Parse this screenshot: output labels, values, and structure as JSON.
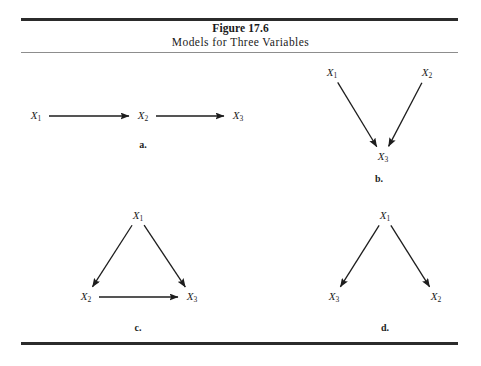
{
  "figure": {
    "number": "Figure 17.6",
    "caption": "Models for Three Variables"
  },
  "chart_data": {
    "type": "diagram",
    "title": "Figure 17.6",
    "subtitle": "Models for Three Variables",
    "panels": [
      {
        "id": "a",
        "label": "a.",
        "layout": "chain-horizontal",
        "nodes": [
          {
            "id": "X1",
            "text": "X",
            "sub": "1",
            "x": 36,
            "y": 116
          },
          {
            "id": "X2",
            "text": "X",
            "sub": "2",
            "x": 143,
            "y": 116
          },
          {
            "id": "X3",
            "text": "X",
            "sub": "3",
            "x": 238,
            "y": 116
          }
        ],
        "edges": [
          {
            "from": "X1",
            "to": "X2"
          },
          {
            "from": "X2",
            "to": "X3"
          }
        ],
        "label_pos": {
          "x": 143,
          "y": 144
        }
      },
      {
        "id": "b",
        "label": "b.",
        "layout": "converging",
        "nodes": [
          {
            "id": "X1",
            "text": "X",
            "sub": "1",
            "x": 332,
            "y": 73
          },
          {
            "id": "X2",
            "text": "X",
            "sub": "2",
            "x": 427,
            "y": 73
          },
          {
            "id": "X3",
            "text": "X",
            "sub": "3",
            "x": 383,
            "y": 157
          }
        ],
        "edges": [
          {
            "from": "X1",
            "to": "X3"
          },
          {
            "from": "X2",
            "to": "X3"
          }
        ],
        "label_pos": {
          "x": 379,
          "y": 178
        }
      },
      {
        "id": "c",
        "label": "c.",
        "layout": "triangle",
        "nodes": [
          {
            "id": "X1",
            "text": "X",
            "sub": "1",
            "x": 138,
            "y": 216
          },
          {
            "id": "X2",
            "text": "X",
            "sub": "2",
            "x": 86,
            "y": 297
          },
          {
            "id": "X3",
            "text": "X",
            "sub": "3",
            "x": 192,
            "y": 297
          }
        ],
        "edges": [
          {
            "from": "X1",
            "to": "X2"
          },
          {
            "from": "X1",
            "to": "X3"
          },
          {
            "from": "X2",
            "to": "X3"
          }
        ],
        "label_pos": {
          "x": 138,
          "y": 327
        }
      },
      {
        "id": "d",
        "label": "d.",
        "layout": "diverging",
        "nodes": [
          {
            "id": "X1",
            "text": "X",
            "sub": "1",
            "x": 385,
            "y": 216
          },
          {
            "id": "X3",
            "text": "X",
            "sub": "3",
            "x": 334,
            "y": 297
          },
          {
            "id": "X2",
            "text": "X",
            "sub": "2",
            "x": 436,
            "y": 297
          }
        ],
        "edges": [
          {
            "from": "X1",
            "to": "X3"
          },
          {
            "from": "X1",
            "to": "X2"
          }
        ],
        "label_pos": {
          "x": 385,
          "y": 327
        }
      }
    ],
    "colors": {
      "ink": "#1d1d1d",
      "rule_heavy": "#2b2b2b",
      "rule_light": "#8d8d8d",
      "background": "#ffffff"
    }
  }
}
